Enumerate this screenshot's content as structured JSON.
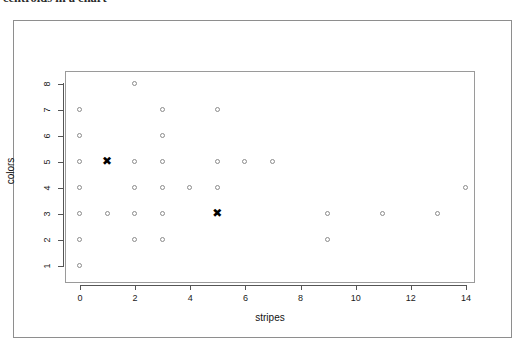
{
  "caption": {
    "text": "centroids in a chart"
  },
  "chart_data": {
    "type": "scatter",
    "title": "",
    "xlabel": "stripes",
    "ylabel": "colors",
    "xlim": [
      -0.6,
      14.9
    ],
    "ylim": [
      0.6,
      8.4
    ],
    "xticks": [
      0,
      2,
      4,
      6,
      8,
      10,
      12,
      14
    ],
    "yticks": [
      1,
      2,
      3,
      4,
      5,
      6,
      7,
      8
    ],
    "grid": false,
    "legend": null,
    "series": [
      {
        "name": "data-points",
        "marker": "open-circle",
        "color": "#8b8b8b",
        "points": [
          [
            0,
            7
          ],
          [
            0,
            6
          ],
          [
            0,
            5
          ],
          [
            0,
            4
          ],
          [
            0,
            3
          ],
          [
            0,
            2
          ],
          [
            0,
            1
          ],
          [
            1,
            3
          ],
          [
            2,
            8
          ],
          [
            2,
            5
          ],
          [
            2,
            4
          ],
          [
            2,
            3
          ],
          [
            2,
            2
          ],
          [
            3,
            7
          ],
          [
            3,
            6
          ],
          [
            3,
            5
          ],
          [
            3,
            4
          ],
          [
            3,
            3
          ],
          [
            3,
            2
          ],
          [
            4,
            4
          ],
          [
            5,
            7
          ],
          [
            5,
            5
          ],
          [
            5,
            4
          ],
          [
            6,
            5
          ],
          [
            7,
            5
          ],
          [
            9,
            3
          ],
          [
            9,
            2
          ],
          [
            11,
            3
          ],
          [
            13,
            3
          ],
          [
            14,
            4
          ]
        ]
      },
      {
        "name": "centroids",
        "marker": "filled-x",
        "color": "#000000",
        "points": [
          [
            1,
            5
          ],
          [
            5,
            3
          ]
        ]
      }
    ]
  }
}
